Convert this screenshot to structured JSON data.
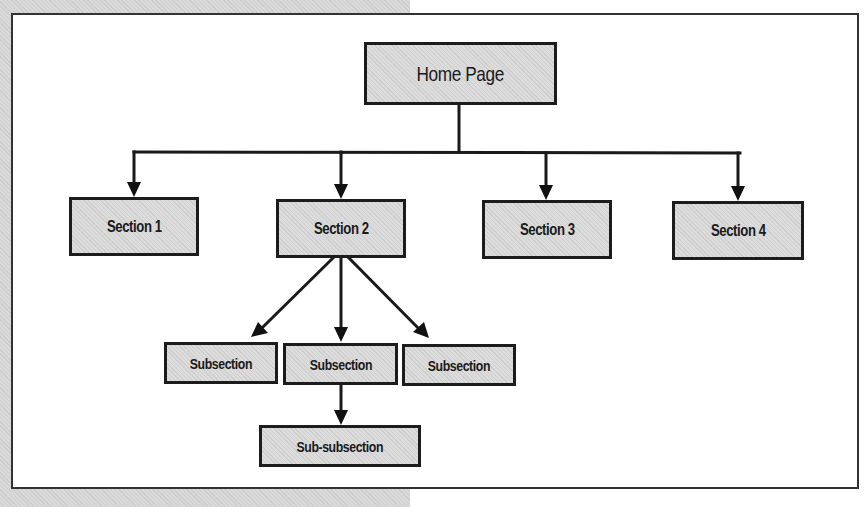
{
  "diagram": {
    "type": "site-hierarchy-tree",
    "colors": {
      "box_fill": "#dcdcdc",
      "box_border": "#1c1c1c",
      "connector": "#1a1a1a",
      "frame_border": "#333333",
      "background_texture": "#d9d9d9"
    },
    "root": {
      "label": "Home Page"
    },
    "sections": [
      {
        "label": "Section 1"
      },
      {
        "label": "Section 2"
      },
      {
        "label": "Section 3"
      },
      {
        "label": "Section 4"
      }
    ],
    "section2_children": [
      {
        "label": "Subsection"
      },
      {
        "label": "Subsection"
      },
      {
        "label": "Subsection"
      }
    ],
    "subsection2_children": [
      {
        "label": "Sub-subsection"
      }
    ],
    "edges": [
      {
        "from": "Home Page",
        "to": "Section 1"
      },
      {
        "from": "Home Page",
        "to": "Section 2"
      },
      {
        "from": "Home Page",
        "to": "Section 3"
      },
      {
        "from": "Home Page",
        "to": "Section 4"
      },
      {
        "from": "Section 2",
        "to": "Subsection (left)"
      },
      {
        "from": "Section 2",
        "to": "Subsection (middle)"
      },
      {
        "from": "Section 2",
        "to": "Subsection (right)"
      },
      {
        "from": "Subsection (middle)",
        "to": "Sub-subsection"
      }
    ]
  }
}
